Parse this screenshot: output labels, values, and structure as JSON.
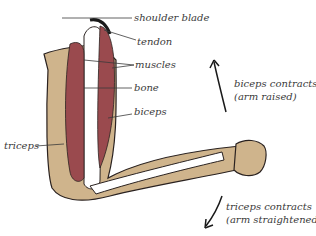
{
  "diagram": {
    "labels": {
      "shoulder_blade": "shoulder blade",
      "tendon": "tendon",
      "muscles": "muscles",
      "bone": "bone",
      "biceps": "biceps",
      "triceps": "triceps"
    },
    "annotations": {
      "biceps_line1": "biceps contracts",
      "biceps_line2": "(arm raised)",
      "triceps_line1": "triceps contracts",
      "triceps_line2": "(arm straightened)"
    },
    "colors": {
      "skin": "#cfb48c",
      "muscle": "#9a4a4e",
      "bone": "#ffffff",
      "outline": "#2a2220",
      "text": "#3a3a3a"
    }
  }
}
